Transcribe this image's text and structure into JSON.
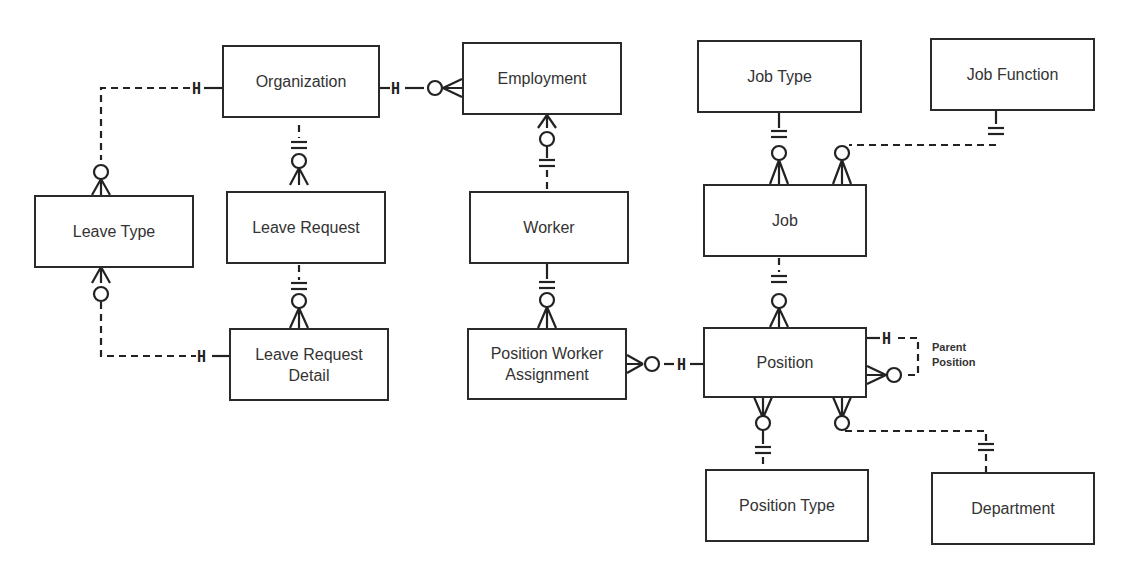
{
  "diagram": {
    "type": "entity-relationship",
    "notation": "crow's foot",
    "entities": [
      {
        "id": "organization",
        "label": "Organization"
      },
      {
        "id": "employment",
        "label": "Employment"
      },
      {
        "id": "job_type",
        "label": "Job Type"
      },
      {
        "id": "job_function",
        "label": "Job Function"
      },
      {
        "id": "leave_type",
        "label": "Leave Type"
      },
      {
        "id": "leave_request",
        "label": "Leave Request"
      },
      {
        "id": "worker",
        "label": "Worker"
      },
      {
        "id": "job",
        "label": "Job"
      },
      {
        "id": "leave_request_detail",
        "label": "Leave Request Detail"
      },
      {
        "id": "position_worker_assignment",
        "label": "Position Worker Assignment"
      },
      {
        "id": "position",
        "label": "Position"
      },
      {
        "id": "position_type",
        "label": "Position Type"
      },
      {
        "id": "department",
        "label": "Department"
      }
    ],
    "relationships": [
      {
        "from": "organization",
        "from_card": "exactly-one",
        "to": "leave_type",
        "to_card": "zero-or-many",
        "line": "dashed"
      },
      {
        "from": "organization",
        "from_card": "exactly-one",
        "to": "employment",
        "to_card": "zero-or-many",
        "line": "dashed"
      },
      {
        "from": "organization",
        "from_card": "exactly-one",
        "to": "leave_request",
        "to_card": "zero-or-many",
        "line": "solid"
      },
      {
        "from": "leave_request",
        "from_card": "exactly-one",
        "to": "leave_request_detail",
        "to_card": "zero-or-many",
        "line": "solid"
      },
      {
        "from": "leave_type",
        "from_card": "exactly-one",
        "to": "leave_request_detail",
        "to_card": "zero-or-many",
        "line": "dashed"
      },
      {
        "from": "worker",
        "from_card": "exactly-one",
        "to": "employment",
        "to_card": "zero-or-many",
        "line": "solid"
      },
      {
        "from": "worker",
        "from_card": "exactly-one",
        "to": "position_worker_assignment",
        "to_card": "zero-or-many",
        "line": "solid"
      },
      {
        "from": "position",
        "from_card": "exactly-one",
        "to": "position_worker_assignment",
        "to_card": "zero-or-many",
        "line": "dashed"
      },
      {
        "from": "job_type",
        "from_card": "exactly-one",
        "to": "job",
        "to_card": "zero-or-many",
        "line": "solid"
      },
      {
        "from": "job_function",
        "from_card": "exactly-one",
        "to": "job",
        "to_card": "zero-or-many",
        "line": "dashed"
      },
      {
        "from": "job",
        "from_card": "exactly-one",
        "to": "position",
        "to_card": "zero-or-many",
        "line": "solid"
      },
      {
        "from": "position",
        "from_card": "exactly-one",
        "to": "position",
        "to_card": "zero-or-many",
        "line": "dashed",
        "label": "Parent Position"
      },
      {
        "from": "position_type",
        "from_card": "exactly-one",
        "to": "position",
        "to_card": "zero-or-many",
        "line": "solid"
      },
      {
        "from": "department",
        "from_card": "exactly-one",
        "to": "position",
        "to_card": "zero-or-many",
        "line": "dashed"
      }
    ],
    "annotations": {
      "parent_position": "Parent Position"
    },
    "colors": {
      "line": "#222222",
      "box_border": "#2a2a2a",
      "text": "#333333",
      "background": "#ffffff"
    }
  }
}
